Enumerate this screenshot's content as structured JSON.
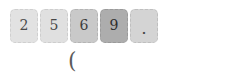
{
  "keypad": {
    "keys": [
      {
        "label": "2",
        "state": "normal",
        "fill": "#e2e2e2"
      },
      {
        "label": "5",
        "state": "normal",
        "fill": "#e0e0e0"
      },
      {
        "label": "6",
        "state": "hover",
        "fill": "#c9c9c9"
      },
      {
        "label": "9",
        "state": "pressed",
        "fill": "#adadad"
      },
      {
        "label": ".",
        "state": "normal",
        "fill": "#d4d4d4"
      }
    ]
  },
  "entry": {
    "text": "("
  },
  "colors": {
    "background": "#ffffff",
    "key_text": "#3a3a3a",
    "key_border": "#b8b8b8",
    "paren_text": "#5b5b5b"
  }
}
